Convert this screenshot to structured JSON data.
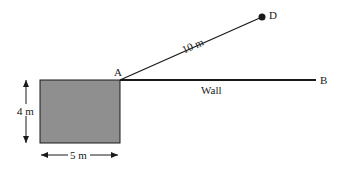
{
  "diagram": {
    "points": {
      "A": {
        "label": "A"
      },
      "B": {
        "label": "B"
      },
      "D": {
        "label": "D"
      }
    },
    "labels": {
      "ad_length": "10 m",
      "wall": "Wall",
      "height": "4 m",
      "width": "5 m"
    },
    "colors": {
      "rect_fill": "#8f8f8f",
      "stroke": "#1a1a1a"
    }
  }
}
